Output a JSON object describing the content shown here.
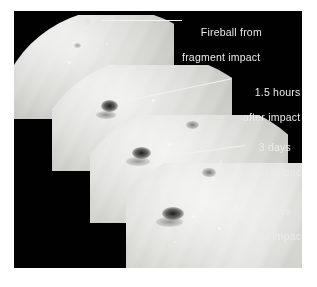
{
  "figure": {
    "background_color": "#ffffff",
    "plate_color": "#010101",
    "annotation_color": "#ebebeb",
    "leader_color": "#f2f2f2"
  },
  "annotations": [
    {
      "id": "fireball",
      "line1": "Fireball from",
      "line2": "fragment impact",
      "panel": "Panel 1 — fireball at moment of fragment impact"
    },
    {
      "id": "hours-1-5",
      "line1": "1.5 hours",
      "line2": "after impact",
      "panel": "Panel 2 — dark impact scar 1.5 hours after impact"
    },
    {
      "id": "days-3",
      "line1": "3 days",
      "line2": "after impact",
      "panel": "Panel 3 — impact scar 3 days after impact"
    },
    {
      "id": "days-5",
      "line1": "5 days",
      "line2": "after impact",
      "panel": "Panel 4 — impact scar 5 days after impact"
    }
  ],
  "panels": [
    {
      "id": "panel-1",
      "label": "fireball-crescent"
    },
    {
      "id": "panel-2",
      "label": "one-point-five-hours-crescent"
    },
    {
      "id": "panel-3",
      "label": "three-days-crescent"
    },
    {
      "id": "panel-4",
      "label": "five-days-globe"
    }
  ]
}
